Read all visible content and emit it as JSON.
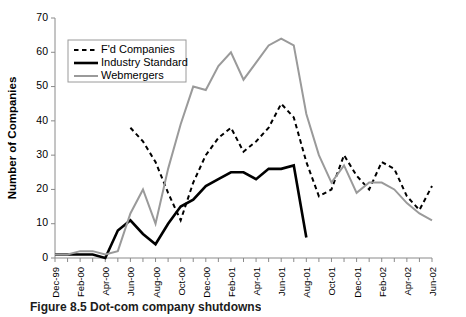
{
  "figure": {
    "caption": "Figure 8.5  Dot-com company shutdowns"
  },
  "chart_data": {
    "type": "line",
    "title": "",
    "xlabel": "",
    "ylabel": "Number of Companies",
    "ylim": [
      0,
      70
    ],
    "yticks": [
      0,
      10,
      20,
      30,
      40,
      50,
      60,
      70
    ],
    "grid": false,
    "legend_position": "top-left",
    "x": [
      "Dec-99",
      "Jan-00",
      "Feb-00",
      "Mar-00",
      "Apr-00",
      "May-00",
      "Jun-00",
      "Jul-00",
      "Aug-00",
      "Sep-00",
      "Oct-00",
      "Nov-00",
      "Dec-00",
      "Jan-01",
      "Feb-01",
      "Mar-01",
      "Apr-01",
      "May-01",
      "Jun-01",
      "Jul-01",
      "Aug-01",
      "Sep-01",
      "Oct-01",
      "Nov-01",
      "Dec-01",
      "Jan-02",
      "Feb-02",
      "Mar-02",
      "Apr-02",
      "May-02",
      "Jun-02"
    ],
    "xtick_labels": [
      "Dec-99",
      "Feb-00",
      "Apr-00",
      "Jun-00",
      "Aug-00",
      "Oct-00",
      "Dec-00",
      "Feb-01",
      "Apr-01",
      "Jun-01",
      "Aug-01",
      "Oct-01",
      "Dec-01",
      "Feb-02",
      "Apr-02",
      "Jun-02"
    ],
    "series": [
      {
        "name": "F'd Companies",
        "color": "#000000",
        "style": "dashed",
        "width": 2,
        "values": [
          null,
          null,
          null,
          null,
          null,
          null,
          38,
          34,
          28,
          19,
          11,
          22,
          30,
          35,
          38,
          31,
          34,
          38,
          45,
          41,
          28,
          18,
          20,
          30,
          24,
          20,
          28,
          26,
          18,
          14,
          21
        ]
      },
      {
        "name": "Industry Standard",
        "color": "#000000",
        "style": "solid",
        "width": 2.6,
        "values": [
          1,
          1,
          1,
          1,
          0,
          8,
          11,
          7,
          4,
          10,
          15,
          17,
          21,
          23,
          25,
          25,
          23,
          26,
          26,
          27,
          6,
          null,
          null,
          null,
          null,
          null,
          null,
          null,
          null,
          null,
          null
        ]
      },
      {
        "name": "Webmergers",
        "color": "#9a9a9a",
        "style": "solid",
        "width": 2,
        "values": [
          1,
          1,
          2,
          2,
          1,
          2,
          13,
          20,
          10,
          26,
          39,
          50,
          49,
          56,
          60,
          52,
          57,
          62,
          64,
          62,
          42,
          30,
          22,
          27,
          19,
          22,
          22,
          20,
          16,
          13,
          11
        ]
      }
    ]
  }
}
